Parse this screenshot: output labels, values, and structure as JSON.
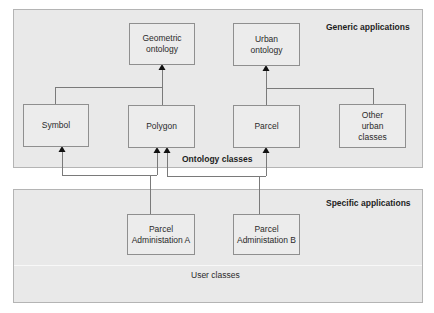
{
  "panels": {
    "generic": {
      "label": "Generic applications",
      "sublabel": "Ontology classes"
    },
    "specific": {
      "label": "Specific applications",
      "sublabel": "User classes"
    }
  },
  "boxes": {
    "geometric_ontology": {
      "line1": "Geometric",
      "line2": "ontology"
    },
    "urban_ontology": {
      "line1": "Urban",
      "line2": "ontology"
    },
    "symbol": {
      "line1": "Symbol"
    },
    "polygon": {
      "line1": "Polygon"
    },
    "parcel": {
      "line1": "Parcel"
    },
    "other_urban_classes": {
      "line1": "Other",
      "line2": "urban",
      "line3": "classes"
    },
    "parcel_admin_a": {
      "line1": "Parcel",
      "line2": "Administation A"
    },
    "parcel_admin_b": {
      "line1": "Parcel",
      "line2": "Administation B"
    }
  },
  "relations": [
    {
      "from": "symbol",
      "to": "geometric_ontology",
      "type": "inheritance"
    },
    {
      "from": "polygon",
      "to": "geometric_ontology",
      "type": "inheritance"
    },
    {
      "from": "parcel",
      "to": "urban_ontology",
      "type": "inheritance"
    },
    {
      "from": "other_urban_classes",
      "to": "urban_ontology",
      "type": "inheritance"
    },
    {
      "from": "parcel_admin_a",
      "to": "symbol",
      "type": "inheritance"
    },
    {
      "from": "parcel_admin_a",
      "to": "polygon",
      "type": "inheritance"
    },
    {
      "from": "parcel_admin_b",
      "to": "polygon",
      "type": "inheritance"
    },
    {
      "from": "parcel_admin_b",
      "to": "parcel",
      "type": "inheritance"
    }
  ],
  "colors": {
    "panel_fill": "#e9e9e9",
    "box_border": "#8f8f8f",
    "line": "#777777",
    "arrow": "#111111"
  }
}
